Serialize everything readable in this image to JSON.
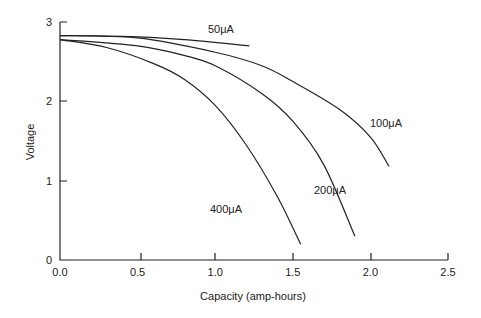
{
  "chart_data": {
    "type": "line",
    "title": "",
    "xlabel": "Capacity (amp-hours)",
    "ylabel": "Voltage",
    "xlim": [
      0,
      2.5
    ],
    "ylim": [
      0,
      3
    ],
    "x_ticks": [
      "0.0",
      "0.5",
      "1.0",
      "1.5",
      "2.0",
      "2.5"
    ],
    "y_ticks": [
      "0",
      "1",
      "2",
      "3"
    ],
    "grid": false,
    "legend": "inline labels",
    "series": [
      {
        "name": "50μA",
        "points": [
          [
            0,
            2.83
          ],
          [
            0.4,
            2.82
          ],
          [
            0.8,
            2.78
          ],
          [
            1.22,
            2.7
          ]
        ]
      },
      {
        "name": "100μA",
        "points": [
          [
            0,
            2.83
          ],
          [
            0.5,
            2.8
          ],
          [
            1.0,
            2.62
          ],
          [
            1.3,
            2.45
          ],
          [
            1.5,
            2.25
          ],
          [
            1.8,
            1.9
          ],
          [
            2.0,
            1.55
          ],
          [
            2.12,
            1.18
          ]
        ]
      },
      {
        "name": "200μA",
        "points": [
          [
            0,
            2.78
          ],
          [
            0.5,
            2.7
          ],
          [
            0.8,
            2.58
          ],
          [
            1.0,
            2.45
          ],
          [
            1.3,
            2.1
          ],
          [
            1.5,
            1.75
          ],
          [
            1.7,
            1.2
          ],
          [
            1.9,
            0.3
          ]
        ]
      },
      {
        "name": "400μA",
        "points": [
          [
            0,
            2.78
          ],
          [
            0.3,
            2.68
          ],
          [
            0.6,
            2.48
          ],
          [
            0.8,
            2.28
          ],
          [
            1.0,
            1.95
          ],
          [
            1.2,
            1.45
          ],
          [
            1.4,
            0.8
          ],
          [
            1.55,
            0.2
          ]
        ]
      }
    ]
  }
}
